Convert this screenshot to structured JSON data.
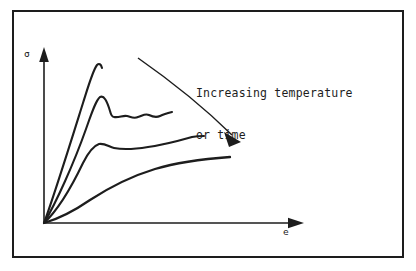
{
  "figure": {
    "kind": "stress-strain-schematic",
    "background_color": "#ffffff",
    "ink_color": "#1d1d1d",
    "border": {
      "x": 12,
      "y": 10,
      "width": 392,
      "height": 248,
      "stroke_width": 2
    },
    "axes": {
      "y_label": "σ",
      "x_label": "e",
      "origin": [
        44,
        223
      ],
      "y_axis_top": [
        44,
        52
      ],
      "x_axis_right": [
        303,
        223
      ]
    },
    "annotation": {
      "line1": "Increasing temperature",
      "line2": "or time",
      "arrow": {
        "from": [
          138,
          58
        ],
        "to": [
          240,
          141
        ]
      }
    }
  },
  "chart_data": {
    "type": "line",
    "title": "",
    "subtitle": "",
    "xlabel": "e",
    "ylabel": "σ",
    "grid": false,
    "legend": null,
    "annotations": [
      {
        "text": "Increasing temperature or time",
        "kind": "arrow-label",
        "direction": "down-right"
      }
    ],
    "xlim": [
      0,
      1
    ],
    "ylim": [
      0,
      1
    ],
    "axis_units": "arbitrary (schematic)",
    "series": [
      {
        "name": "curve-1-lowest-temperature",
        "note": "steepest elastic slope, highest peak stress, fractures at peak",
        "path": "M 44 223 C 54 196 72 138 83 103 C 89 84 93 70 97 65 C 99 63 101 64 102 68",
        "points": [
          [
            0.0,
            0.0
          ],
          [
            0.08,
            0.3
          ],
          [
            0.14,
            0.6
          ],
          [
            0.19,
            0.8
          ],
          [
            0.23,
            0.92
          ],
          [
            0.25,
            0.95
          ],
          [
            0.26,
            0.92
          ]
        ]
      },
      {
        "name": "curve-2",
        "note": "upper yield point then serrated (jerky-flow) plateau",
        "path": "M 44 223 C 56 203 74 163 86 129 C 92 112 96 100 100 97 C 104 95 107 101 110 111 C 111 115 112 117 114 117 C 119 118 123 115 127 116 C 131 117 134 119 138 117 C 142 116 145 113 149 115 C 153 117 156 118 160 116 C 164 114 168 113 172 112",
        "points": [
          [
            0.0,
            0.0
          ],
          [
            0.1,
            0.38
          ],
          [
            0.18,
            0.66
          ],
          [
            0.22,
            0.79
          ],
          [
            0.25,
            0.82
          ],
          [
            0.29,
            0.71
          ],
          [
            0.35,
            0.7
          ],
          [
            0.42,
            0.69
          ],
          [
            0.49,
            0.7
          ],
          [
            0.56,
            0.69
          ],
          [
            0.63,
            0.71
          ]
        ]
      },
      {
        "name": "curve-3",
        "note": "lower modulus, small yield drop then gradual hardening",
        "path": "M 44 223 C 57 211 72 186 83 163 C 88 153 93 146 99 144 C 105 143 109 147 114 148 C 124 150 136 149 148 147 C 163 145 178 141 192 137 C 197 136 201 136 204 136",
        "points": [
          [
            0.0,
            0.0
          ],
          [
            0.09,
            0.2
          ],
          [
            0.17,
            0.4
          ],
          [
            0.22,
            0.5
          ],
          [
            0.26,
            0.52
          ],
          [
            0.32,
            0.5
          ],
          [
            0.42,
            0.5
          ],
          [
            0.55,
            0.52
          ],
          [
            0.68,
            0.55
          ],
          [
            0.76,
            0.56
          ]
        ]
      },
      {
        "name": "curve-4-highest-temperature",
        "note": "lowest modulus, smooth saturating flow curve, no yield drop",
        "path": "M 44 223 C 58 219 74 211 90 200 C 110 187 132 176 155 169 C 178 162 202 159 230 157",
        "points": [
          [
            0.0,
            0.0
          ],
          [
            0.1,
            0.06
          ],
          [
            0.2,
            0.15
          ],
          [
            0.32,
            0.24
          ],
          [
            0.45,
            0.3
          ],
          [
            0.6,
            0.34
          ],
          [
            0.74,
            0.36
          ],
          [
            0.86,
            0.38
          ]
        ]
      }
    ]
  }
}
